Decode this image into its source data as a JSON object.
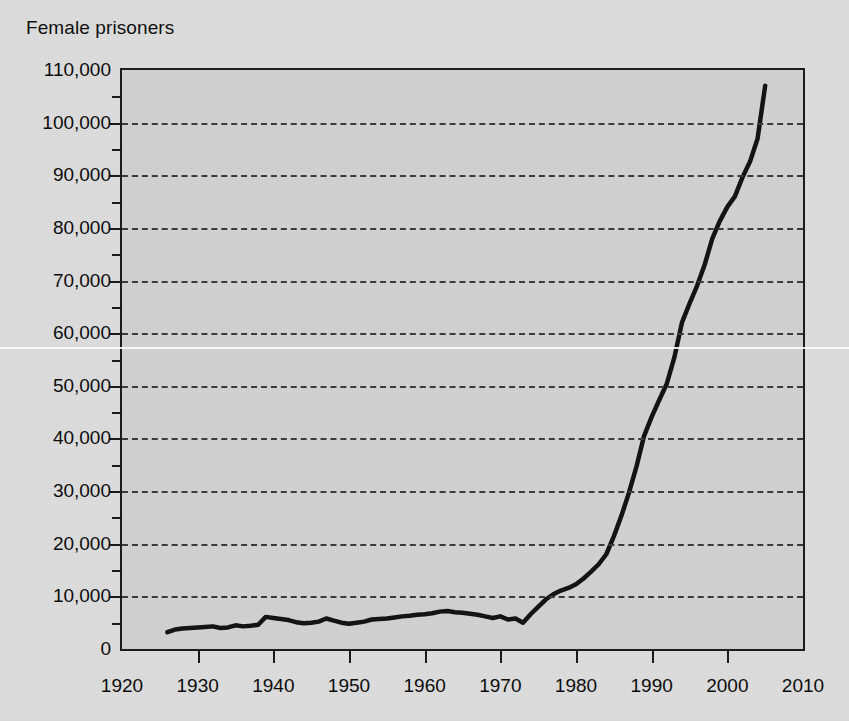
{
  "chart_data": {
    "type": "line",
    "title": "Female prisoners",
    "xlabel": "",
    "ylabel": "",
    "grid": "horizontal-dashed",
    "legend": "none",
    "xlim": [
      1920,
      2010
    ],
    "ylim": [
      0,
      110000
    ],
    "x_ticks": [
      1920,
      1930,
      1940,
      1950,
      1960,
      1970,
      1980,
      1990,
      2000,
      2010
    ],
    "x_tick_labels": [
      "1920",
      "1930",
      "1940",
      "1950",
      "1960",
      "1970",
      "1980",
      "1990",
      "2000",
      "2010"
    ],
    "y_ticks": [
      0,
      10000,
      20000,
      30000,
      40000,
      50000,
      60000,
      70000,
      80000,
      90000,
      100000,
      110000
    ],
    "y_tick_labels": [
      "0",
      "10,000",
      "20,000",
      "30,000",
      "40,000",
      "50,000",
      "60,000",
      "70,000",
      "80,000",
      "90,000",
      "100,000",
      "110,000"
    ],
    "y_minor_ticks": [
      5000,
      15000,
      25000,
      35000,
      45000,
      55000,
      65000,
      75000,
      85000,
      95000,
      105000
    ],
    "series": [
      {
        "name": "Female prisoners",
        "color": "#111111",
        "x": [
          1926,
          1927,
          1928,
          1929,
          1930,
          1931,
          1932,
          1933,
          1934,
          1935,
          1936,
          1937,
          1938,
          1939,
          1940,
          1941,
          1942,
          1943,
          1944,
          1945,
          1946,
          1947,
          1948,
          1949,
          1950,
          1951,
          1952,
          1953,
          1954,
          1955,
          1956,
          1957,
          1958,
          1959,
          1960,
          1961,
          1962,
          1963,
          1964,
          1965,
          1966,
          1967,
          1968,
          1969,
          1970,
          1971,
          1972,
          1973,
          1974,
          1975,
          1976,
          1977,
          1978,
          1979,
          1980,
          1981,
          1982,
          1983,
          1984,
          1985,
          1986,
          1987,
          1988,
          1989,
          1990,
          1991,
          1992,
          1993,
          1994,
          1995,
          1996,
          1997,
          1998,
          1999,
          2000,
          2001,
          2002,
          2003,
          2004,
          2005
        ],
        "y": [
          3200,
          3700,
          3900,
          4000,
          4100,
          4200,
          4300,
          4000,
          4100,
          4500,
          4300,
          4400,
          4600,
          6100,
          5900,
          5700,
          5500,
          5100,
          4900,
          5000,
          5200,
          5800,
          5400,
          5000,
          4800,
          5000,
          5200,
          5600,
          5700,
          5800,
          6000,
          6200,
          6300,
          6500,
          6600,
          6800,
          7100,
          7200,
          7000,
          6900,
          6700,
          6500,
          6200,
          5900,
          6200,
          5600,
          5800,
          5000,
          6600,
          8000,
          9400,
          10400,
          11100,
          11600,
          12300,
          13400,
          14700,
          16100,
          18000,
          21400,
          25300,
          29700,
          34700,
          40500,
          44100,
          47300,
          50400,
          55400,
          62000,
          65600,
          69000,
          73000,
          77900,
          81300,
          84000,
          86000,
          89600,
          92600,
          97000,
          107000
        ]
      }
    ]
  },
  "title": {
    "text": "Female prisoners"
  }
}
